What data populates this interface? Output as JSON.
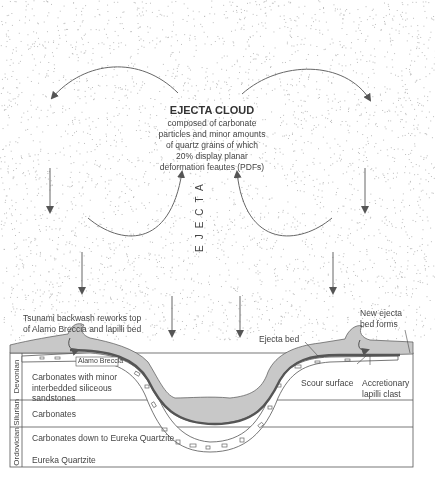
{
  "diagram": {
    "type": "geologic-cross-section",
    "ejecta_cloud": {
      "title": "EJECTA CLOUD",
      "description_lines": "composed of carbonate\nparticles and minor amounts\nof quartz grains of which\n20% display planar\ndeformation feautes (PDFs)"
    },
    "vertical_label": "EJECTA",
    "annotations": {
      "tsunami_backwash": "Tsunami backwash reworks top\nof Alamo Breccia and lapilli bed",
      "new_ejecta_bed": "New ejecta\nbed forms",
      "ejecta_bed": "Ejecta bed",
      "scour_surface": "Scour surface",
      "accretionary_lapilli": "Accretionary\nlapilli clast",
      "alamo_breccia": "Alamo Breccia"
    },
    "periods": [
      {
        "name": "Devonian"
      },
      {
        "name": "Silurian"
      },
      {
        "name": "Ordovician"
      }
    ],
    "layers": [
      {
        "label": "Carbonates with minor\ninterbedded siliceous\nsandstones"
      },
      {
        "label": "Carbonates"
      },
      {
        "label": "Carbonates down to Eureka Quartzite"
      },
      {
        "label": "Eureka Quartzite"
      }
    ],
    "colors": {
      "ejecta_fill": "#c8c8c8",
      "ejecta_bed_line": "#555555",
      "outline": "#555555",
      "stipple": "#bdbdbd"
    }
  }
}
